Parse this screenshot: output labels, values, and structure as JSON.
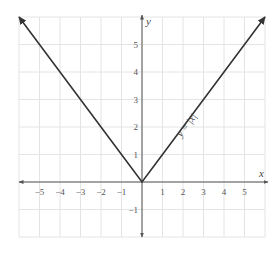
{
  "chart_data": {
    "type": "line",
    "title": "",
    "xlabel": "x",
    "ylabel": "y",
    "xlim": [
      -6,
      6
    ],
    "ylim": [
      -2,
      6
    ],
    "grid": true,
    "x_ticks": [
      -5,
      -4,
      -3,
      -2,
      -1,
      1,
      2,
      3,
      4,
      5
    ],
    "y_ticks": [
      -1,
      1,
      2,
      3,
      4,
      5
    ],
    "x_tick_labels": [
      "−5",
      "−4",
      "−3",
      "−2",
      "−1",
      "1",
      "2",
      "3",
      "4",
      "5"
    ],
    "y_tick_labels": [
      "−1",
      "1",
      "2",
      "3",
      "4",
      "5"
    ],
    "series": [
      {
        "name": "y = |x|",
        "x": [
          -6,
          -5,
          -4,
          -3,
          -2,
          -1,
          0,
          1,
          2,
          3,
          4,
          5,
          6
        ],
        "y": [
          6,
          5,
          4,
          3,
          2,
          1,
          0,
          1,
          2,
          3,
          4,
          5,
          6
        ],
        "arrows_at_ends": true
      }
    ],
    "annotations": [
      {
        "text": "y = |x|",
        "x": 2.3,
        "y": 2,
        "rotation": -53
      }
    ],
    "colors": {
      "line": "#333333",
      "axis": "#555555",
      "grid": "#e4e4e4"
    }
  },
  "labels": {
    "x_axis": "x",
    "y_axis": "y",
    "function": "y = |x|"
  }
}
